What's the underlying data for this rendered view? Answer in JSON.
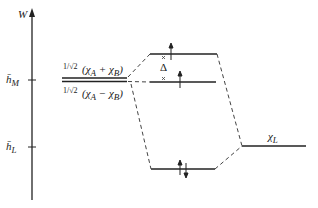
{
  "diagram": {
    "axis": {
      "label": "W"
    },
    "left_ticks": [
      {
        "label": "h̄",
        "subscript": "M",
        "y": 80
      },
      {
        "label": "h̄",
        "subscript": "L",
        "y": 147
      }
    ],
    "metal_combinations": [
      {
        "prefix": "1/√2",
        "expr": "(χ_A + χ_B)",
        "text": "(χ",
        "sub1": "A",
        "op": " + χ",
        "sub2": "B",
        "close": ")"
      },
      {
        "prefix": "1/√2",
        "expr": "(χ_A − χ_B)",
        "text": "(χ",
        "sub1": "A",
        "op": " − χ",
        "sub2": "B",
        "close": ")"
      }
    ],
    "mo_levels": [
      {
        "name": "upper-antibonding",
        "electrons": "↑"
      },
      {
        "name": "nonbonding",
        "electrons": "↑"
      },
      {
        "name": "bonding",
        "electrons": "↑↓"
      }
    ],
    "gap_label": "Δ",
    "ligand": {
      "label": "χ",
      "subscript": "L"
    },
    "colors": {
      "line": "#222222",
      "dashed": "#444444"
    }
  }
}
